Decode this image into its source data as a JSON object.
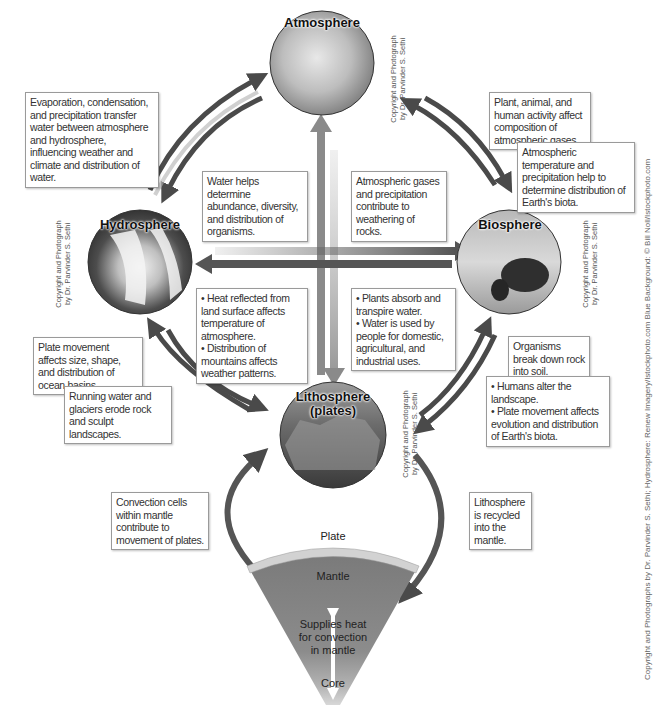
{
  "spheres": {
    "atmosphere": {
      "label": "Atmosphere",
      "credit_line1": "Copyright and Photograph",
      "credit_line2": "by Dr. Parvinder S. Sethi"
    },
    "hydrosphere": {
      "label": "Hydrosphere",
      "credit_line1": "Copyright and Photograph",
      "credit_line2": "by Dr. Parvinder S. Sethi"
    },
    "biosphere": {
      "label": "Biosphere",
      "credit_line1": "Copyright and Photograph",
      "credit_line2": "by Dr. Parvinder S. Sethi"
    },
    "lithosphere": {
      "label_line1": "Lithosphere",
      "label_line2": "(plates)",
      "credit_line1": "Copyright and Photograph",
      "credit_line2": "by Dr. Parvinder S. Sethi"
    }
  },
  "callouts": {
    "atmo_hydro": "Evaporation, condensation, and precipitation transfer water between atmosphere and hydrosphere, influencing weather and climate and distribution of water.",
    "bio_atmo": "Plant, animal, and human activity affect composition of atmospheric gases.",
    "atmo_bio": "Atmospheric temperature and precipitation help to determine distribution of Earth's biota.",
    "hydro_bio": "Water helps determine abundance, diversity, and distribution of organisms.",
    "atmo_litho": "Atmospheric gases and precipitation contribute to weathering of rocks.",
    "litho_atmo_1": "• Heat reflected from land surface affects temperature of atmosphere.",
    "litho_atmo_2": "• Distribution of mountains affects weather patterns.",
    "bio_hydro_1": "• Plants absorb and transpire water.",
    "bio_hydro_2": "• Water is used by people for domestic, agricultural, and industrial uses.",
    "litho_hydro": "Plate movement affects size, shape, and distribution of ocean basins.",
    "hydro_litho": "Running water and glaciers erode rock and sculpt landscapes.",
    "bio_litho": "Organisms break down rock into soil.",
    "litho_bio_1": "• Humans alter the landscape.",
    "litho_bio_2": "• Plate movement affects evolution and distribution of Earth's biota.",
    "mantle_litho": "Convection cells within mantle contribute to movement of plates.",
    "litho_mantle": "Lithosphere is recycled into the mantle."
  },
  "earth_section": {
    "plate": "Plate",
    "mantle": "Mantle",
    "heat_line1": "Supplies heat",
    "heat_line2": "for convection",
    "heat_line3": "in mantle",
    "core": "Core"
  },
  "side_credit": "Copyright and Photographs by Dr. Parvinder S. Sethi; Hydrosphere: Renew Imagery/Istockphoto.com Blue Background: © Bill Noll/Istockphoto.com",
  "colors": {
    "arrow_dark": "#4a4a4a",
    "arrow_light": "#a8a8a8",
    "mantle": "#7d7d7d",
    "core_glow": "#c8c8c8"
  }
}
